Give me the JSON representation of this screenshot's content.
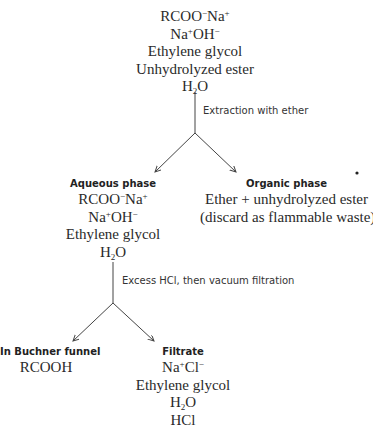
{
  "start_mixture": {
    "items": [
      {
        "base": "RCOO",
        "sup1": "−",
        "mid": "Na",
        "sup2": "+"
      },
      {
        "base": "Na",
        "sup1": "+",
        "mid": "OH",
        "sup2": "−"
      },
      {
        "text": "Ethylene glycol"
      },
      {
        "text": "Unhydrolyzed ester"
      },
      {
        "pre": "H",
        "sub": "2",
        "post": "O"
      }
    ]
  },
  "step1": {
    "label": "Extraction with ether"
  },
  "aqueous_phase": {
    "header": "Aqueous phase",
    "items": [
      {
        "base": "RCOO",
        "sup1": "−",
        "mid": "Na",
        "sup2": "+"
      },
      {
        "base": "Na",
        "sup1": "+",
        "mid": "OH",
        "sup2": "−"
      },
      {
        "text": "Ethylene glycol"
      },
      {
        "pre": "H",
        "sub": "2",
        "post": "O"
      }
    ]
  },
  "organic_phase": {
    "header": "Organic phase",
    "items": [
      {
        "text": "Ether + unhydrolyzed ester"
      },
      {
        "text": "(discard as flammable waste)"
      }
    ]
  },
  "step2": {
    "label": "Excess HCl, then vacuum filtration"
  },
  "buchner_funnel": {
    "header": "In Buchner funnel",
    "items": [
      {
        "text": "RCOOH"
      }
    ]
  },
  "filtrate": {
    "header": "Filtrate",
    "items": [
      {
        "base": "Na",
        "sup1": "+",
        "mid": "Cl",
        "sup2": "−"
      },
      {
        "text": "Ethylene glycol"
      },
      {
        "pre": "H",
        "sub": "2",
        "post": "O"
      },
      {
        "text": "HCl"
      }
    ]
  },
  "colors": {
    "line": "#444444",
    "text": "#2a2a2a"
  }
}
